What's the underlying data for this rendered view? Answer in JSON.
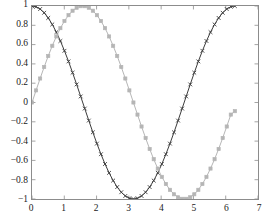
{
  "chart_data": {
    "type": "line",
    "title": "",
    "xlabel": "",
    "ylabel": "",
    "xlim": [
      0,
      7
    ],
    "ylim": [
      -1,
      1
    ],
    "grid": false,
    "legend": "none",
    "background_color": "#ffffff",
    "axis_color": "#8c8c8c",
    "xticks": [
      0,
      1,
      2,
      3,
      4,
      5,
      6,
      7
    ],
    "xtick_labels": [
      "0",
      "1",
      "2",
      "3",
      "4",
      "5",
      "6",
      "7"
    ],
    "yticks": [
      -1,
      -0.8,
      -0.6,
      -0.4,
      -0.2,
      0,
      0.2,
      0.4,
      0.6,
      0.8,
      1
    ],
    "ytick_labels": [
      "−1",
      "−0.8",
      "−0.6",
      "−0.4",
      "−0.2",
      "0",
      "0.2",
      "0.4",
      "0.6",
      "0.8",
      "1"
    ],
    "series": [
      {
        "name": "cosine",
        "color": "#3a3a3a",
        "marker": "x",
        "linestyle": "solid",
        "x": [
          0,
          0.1257,
          0.2513,
          0.377,
          0.5027,
          0.6283,
          0.754,
          0.8796,
          1.0053,
          1.131,
          1.2566,
          1.3823,
          1.508,
          1.6336,
          1.7593,
          1.885,
          2.0106,
          2.1363,
          2.2619,
          2.3876,
          2.5133,
          2.6389,
          2.7646,
          2.8903,
          3.0159,
          3.1416,
          3.2673,
          3.3929,
          3.5186,
          3.6442,
          3.7699,
          3.8956,
          4.0212,
          4.1469,
          4.2726,
          4.3982,
          4.5239,
          4.6496,
          4.7752,
          4.9009,
          5.0265,
          5.1522,
          5.2779,
          5.4035,
          5.5292,
          5.6549,
          5.7805,
          5.9062,
          6.0319,
          6.1575,
          6.2832
        ],
        "y": [
          1,
          0.9921,
          0.9686,
          0.9298,
          0.8763,
          0.809,
          0.729,
          0.6374,
          0.5358,
          0.4258,
          0.309,
          0.1874,
          0.0628,
          -0.0628,
          -0.1874,
          -0.309,
          -0.4258,
          -0.5358,
          -0.6374,
          -0.729,
          -0.809,
          -0.8763,
          -0.9298,
          -0.9686,
          -0.9921,
          -1,
          -0.9921,
          -0.9686,
          -0.9298,
          -0.8763,
          -0.809,
          -0.729,
          -0.6374,
          -0.5358,
          -0.4258,
          -0.309,
          -0.1874,
          -0.0628,
          0.0628,
          0.1874,
          0.309,
          0.4258,
          0.5358,
          0.6374,
          0.729,
          0.809,
          0.8763,
          0.9298,
          0.9686,
          0.9921,
          1
        ]
      },
      {
        "name": "sine",
        "color": "#b5b5b5",
        "marker": "square",
        "linestyle": "solid",
        "x": [
          0,
          0.1257,
          0.2513,
          0.377,
          0.5027,
          0.6283,
          0.754,
          0.8796,
          1.0053,
          1.131,
          1.2566,
          1.3823,
          1.508,
          1.6336,
          1.7593,
          1.885,
          2.0106,
          2.1363,
          2.2619,
          2.3876,
          2.5133,
          2.6389,
          2.7646,
          2.8903,
          3.0159,
          3.1416,
          3.2673,
          3.3929,
          3.5186,
          3.6442,
          3.7699,
          3.8956,
          4.0212,
          4.1469,
          4.2726,
          4.3982,
          4.5239,
          4.6496,
          4.7752,
          4.9009,
          5.0265,
          5.1522,
          5.2779,
          5.4035,
          5.5292,
          5.6549,
          5.7805,
          5.9062,
          6.0319,
          6.1575,
          6.2832
        ],
        "y": [
          0,
          0.1253,
          0.2487,
          0.3681,
          0.4818,
          0.5878,
          0.6845,
          0.7705,
          0.8443,
          0.9048,
          0.9511,
          0.9823,
          0.998,
          0.998,
          0.9823,
          0.9511,
          0.9048,
          0.8443,
          0.7705,
          0.6845,
          0.5878,
          0.4818,
          0.3681,
          0.2487,
          0.1253,
          0,
          -0.1253,
          -0.2487,
          -0.3681,
          -0.4818,
          -0.5878,
          -0.6845,
          -0.7705,
          -0.8443,
          -0.9048,
          -0.9511,
          -0.9823,
          -0.998,
          -0.998,
          -0.9823,
          -0.9511,
          -0.9048,
          -0.8443,
          -0.7705,
          -0.6845,
          -0.5878,
          -0.4818,
          -0.3681,
          -0.2487,
          -0.1253,
          -0.09
        ]
      }
    ]
  }
}
